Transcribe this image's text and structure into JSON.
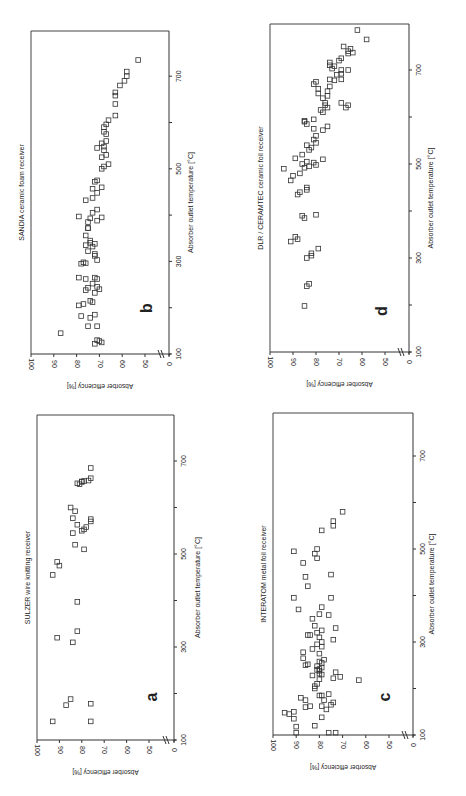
{
  "chart_data": [
    {
      "type": "scatter",
      "panel_letter": "b",
      "title": "SANDIA ceramic foam receiver",
      "xlabel": "Absorber outlet temperature [°C]",
      "ylabel": "Absorber efficiency [%]",
      "xticks": [
        "100",
        "300",
        "500",
        "700"
      ],
      "yticks": [
        "100",
        "90",
        "80",
        "70",
        "60",
        "50",
        "0"
      ],
      "xlim": [
        100,
        800
      ],
      "ylim": [
        0,
        100
      ],
      "axis_break": "y between 0 and 50",
      "points": [
        [
          145,
          87
        ],
        [
          130,
          71
        ],
        [
          128,
          70
        ],
        [
          122,
          72
        ],
        [
          125,
          69
        ],
        [
          160,
          75
        ],
        [
          160,
          71
        ],
        [
          182,
          78
        ],
        [
          178,
          74
        ],
        [
          185,
          72
        ],
        [
          205,
          79
        ],
        [
          208,
          77
        ],
        [
          215,
          74
        ],
        [
          212,
          73
        ],
        [
          238,
          76
        ],
        [
          243,
          75
        ],
        [
          232,
          72
        ],
        [
          245,
          71
        ],
        [
          240,
          70
        ],
        [
          252,
          73
        ],
        [
          265,
          79
        ],
        [
          262,
          76
        ],
        [
          265,
          72
        ],
        [
          262,
          71
        ],
        [
          295,
          78
        ],
        [
          298,
          77
        ],
        [
          296,
          76
        ],
        [
          303,
          71
        ],
        [
          312,
          72
        ],
        [
          316,
          72
        ],
        [
          322,
          75
        ],
        [
          335,
          76
        ],
        [
          340,
          74
        ],
        [
          345,
          74
        ],
        [
          338,
          72
        ],
        [
          332,
          73
        ],
        [
          356,
          76
        ],
        [
          372,
          75
        ],
        [
          372,
          75
        ],
        [
          385,
          75
        ],
        [
          393,
          74
        ],
        [
          397,
          79
        ],
        [
          395,
          69
        ],
        [
          388,
          71
        ],
        [
          405,
          73
        ],
        [
          412,
          71
        ],
        [
          432,
          76
        ],
        [
          437,
          73
        ],
        [
          448,
          71
        ],
        [
          457,
          73
        ],
        [
          460,
          69
        ],
        [
          472,
          72
        ],
        [
          475,
          71
        ],
        [
          500,
          69
        ],
        [
          505,
          68
        ],
        [
          510,
          66
        ],
        [
          525,
          69
        ],
        [
          530,
          67
        ],
        [
          540,
          68
        ],
        [
          545,
          71
        ],
        [
          548,
          68
        ],
        [
          555,
          69
        ],
        [
          560,
          67
        ],
        [
          575,
          67
        ],
        [
          580,
          68
        ],
        [
          590,
          68
        ],
        [
          596,
          67
        ],
        [
          605,
          66
        ],
        [
          615,
          63
        ],
        [
          640,
          63
        ],
        [
          658,
          63
        ],
        [
          665,
          63
        ],
        [
          680,
          61
        ],
        [
          690,
          59
        ],
        [
          700,
          58
        ],
        [
          710,
          58
        ],
        [
          735,
          53
        ]
      ]
    },
    {
      "type": "scatter",
      "panel_letter": "d",
      "title": "DLR / CERAMTEC ceramic foil receiver",
      "xlabel": "Absorber outlet temperature [°C]",
      "ylabel": "Absorber efficiency [%]",
      "xticks": [
        "100",
        "300",
        "500",
        "700"
      ],
      "yticks": [
        "100",
        "90",
        "80",
        "70",
        "60",
        "50",
        "0"
      ],
      "xlim": [
        100,
        800
      ],
      "ylim": [
        0,
        100
      ],
      "axis_break": "y between 0 and 50",
      "points": [
        [
          198,
          85
        ],
        [
          245,
          83
        ],
        [
          240,
          84
        ],
        [
          300,
          84
        ],
        [
          305,
          82
        ],
        [
          310,
          82
        ],
        [
          320,
          79
        ],
        [
          335,
          91
        ],
        [
          340,
          88
        ],
        [
          345,
          89
        ],
        [
          385,
          85
        ],
        [
          390,
          86
        ],
        [
          392,
          80
        ],
        [
          435,
          88
        ],
        [
          440,
          87
        ],
        [
          445,
          84
        ],
        [
          450,
          84
        ],
        [
          465,
          91
        ],
        [
          475,
          90
        ],
        [
          480,
          87
        ],
        [
          490,
          94
        ],
        [
          492,
          85
        ],
        [
          498,
          80
        ],
        [
          495,
          83
        ],
        [
          500,
          86
        ],
        [
          505,
          84
        ],
        [
          503,
          81
        ],
        [
          510,
          77
        ],
        [
          512,
          89
        ],
        [
          520,
          86
        ],
        [
          530,
          83
        ],
        [
          535,
          82
        ],
        [
          540,
          84
        ],
        [
          545,
          80
        ],
        [
          552,
          81
        ],
        [
          560,
          80
        ],
        [
          572,
          77
        ],
        [
          575,
          81
        ],
        [
          580,
          75
        ],
        [
          585,
          84
        ],
        [
          590,
          85
        ],
        [
          592,
          85
        ],
        [
          595,
          81
        ],
        [
          610,
          77
        ],
        [
          615,
          78
        ],
        [
          620,
          75
        ],
        [
          625,
          76
        ],
        [
          630,
          76
        ],
        [
          640,
          77
        ],
        [
          645,
          75
        ],
        [
          650,
          79
        ],
        [
          655,
          75
        ],
        [
          660,
          79
        ],
        [
          665,
          74
        ],
        [
          670,
          81
        ],
        [
          675,
          80
        ],
        [
          678,
          72
        ],
        [
          680,
          74
        ],
        [
          690,
          71
        ],
        [
          692,
          69
        ],
        [
          700,
          69
        ],
        [
          700,
          66
        ],
        [
          703,
          73
        ],
        [
          708,
          72
        ],
        [
          710,
          74
        ],
        [
          716,
          74
        ],
        [
          720,
          70
        ],
        [
          725,
          69
        ],
        [
          735,
          66
        ],
        [
          737,
          64
        ],
        [
          740,
          66
        ],
        [
          745,
          65
        ],
        [
          750,
          68
        ],
        [
          765,
          58
        ],
        [
          785,
          62
        ],
        [
          630,
          69
        ],
        [
          620,
          67
        ],
        [
          625,
          66
        ],
        [
          680,
          69
        ]
      ]
    },
    {
      "type": "scatter",
      "panel_letter": "a",
      "title": "SULZER wire knitting receiver",
      "xlabel": "Absorber outlet temperature [°C]",
      "ylabel": "Absorber efficiency [%]",
      "xticks": [
        "100",
        "300",
        "500",
        "700"
      ],
      "yticks": [
        "100",
        "90",
        "80",
        "70",
        "60",
        "50",
        "0"
      ],
      "xlim": [
        100,
        800
      ],
      "ylim": [
        0,
        100
      ],
      "axis_break": "y between 0 and 50",
      "points": [
        [
          140,
          93
        ],
        [
          140,
          76
        ],
        [
          175,
          87
        ],
        [
          188,
          85
        ],
        [
          178,
          76
        ],
        [
          320,
          91
        ],
        [
          310,
          84
        ],
        [
          334,
          82
        ],
        [
          397,
          82
        ],
        [
          455,
          93
        ],
        [
          475,
          90
        ],
        [
          483,
          91
        ],
        [
          510,
          79
        ],
        [
          520,
          83
        ],
        [
          545,
          84
        ],
        [
          550,
          80
        ],
        [
          553,
          79
        ],
        [
          558,
          78
        ],
        [
          563,
          82
        ],
        [
          570,
          76
        ],
        [
          575,
          76
        ],
        [
          577,
          84
        ],
        [
          592,
          83
        ],
        [
          600,
          85
        ],
        [
          650,
          81
        ],
        [
          652,
          82
        ],
        [
          655,
          80
        ],
        [
          656,
          80
        ],
        [
          657,
          79
        ],
        [
          658,
          77
        ],
        [
          663,
          76
        ],
        [
          685,
          76
        ]
      ]
    },
    {
      "type": "scatter",
      "panel_letter": "c",
      "title": "INTERATOM metal foil receiver",
      "xlabel": "Absorber outlet temperature [°C]",
      "ylabel": "Absorber efficiency [%]",
      "xticks": [
        "100",
        "300",
        "500",
        "700"
      ],
      "yticks": [
        "100",
        "90",
        "80",
        "70",
        "60",
        "50",
        "0"
      ],
      "xlim": [
        100,
        800
      ],
      "ylim": [
        0,
        100
      ],
      "axis_break": "y between 0 and 50",
      "points": [
        [
          105,
          90
        ],
        [
          105,
          73
        ],
        [
          105,
          76
        ],
        [
          118,
          90
        ],
        [
          120,
          82
        ],
        [
          135,
          91
        ],
        [
          138,
          79
        ],
        [
          145,
          93
        ],
        [
          148,
          95
        ],
        [
          150,
          91
        ],
        [
          155,
          77
        ],
        [
          160,
          86
        ],
        [
          162,
          84
        ],
        [
          162,
          79
        ],
        [
          165,
          75
        ],
        [
          170,
          74
        ],
        [
          175,
          86
        ],
        [
          175,
          78
        ],
        [
          180,
          88
        ],
        [
          185,
          80
        ],
        [
          185,
          79
        ],
        [
          188,
          76
        ],
        [
          200,
          82
        ],
        [
          205,
          82
        ],
        [
          210,
          81
        ],
        [
          218,
          63
        ],
        [
          220,
          80
        ],
        [
          222,
          74
        ],
        [
          225,
          71
        ],
        [
          228,
          83
        ],
        [
          230,
          79
        ],
        [
          232,
          80
        ],
        [
          235,
          73
        ],
        [
          238,
          80
        ],
        [
          240,
          81
        ],
        [
          242,
          80
        ],
        [
          245,
          79
        ],
        [
          248,
          81
        ],
        [
          250,
          86
        ],
        [
          252,
          85
        ],
        [
          255,
          79
        ],
        [
          258,
          80
        ],
        [
          262,
          78
        ],
        [
          265,
          87
        ],
        [
          275,
          80
        ],
        [
          278,
          87
        ],
        [
          285,
          83
        ],
        [
          290,
          79
        ],
        [
          295,
          81
        ],
        [
          300,
          79
        ],
        [
          305,
          74
        ],
        [
          310,
          80
        ],
        [
          315,
          84
        ],
        [
          315,
          85
        ],
        [
          320,
          81
        ],
        [
          325,
          79
        ],
        [
          330,
          73
        ],
        [
          335,
          82
        ],
        [
          350,
          83
        ],
        [
          358,
          76
        ],
        [
          360,
          80
        ],
        [
          370,
          89
        ],
        [
          375,
          79
        ],
        [
          395,
          91
        ],
        [
          395,
          75
        ],
        [
          420,
          85
        ],
        [
          440,
          86
        ],
        [
          445,
          75
        ],
        [
          470,
          87
        ],
        [
          480,
          81
        ],
        [
          490,
          82
        ],
        [
          495,
          91
        ],
        [
          500,
          81
        ],
        [
          540,
          79
        ],
        [
          550,
          74
        ],
        [
          560,
          74
        ],
        [
          580,
          70
        ]
      ]
    }
  ]
}
